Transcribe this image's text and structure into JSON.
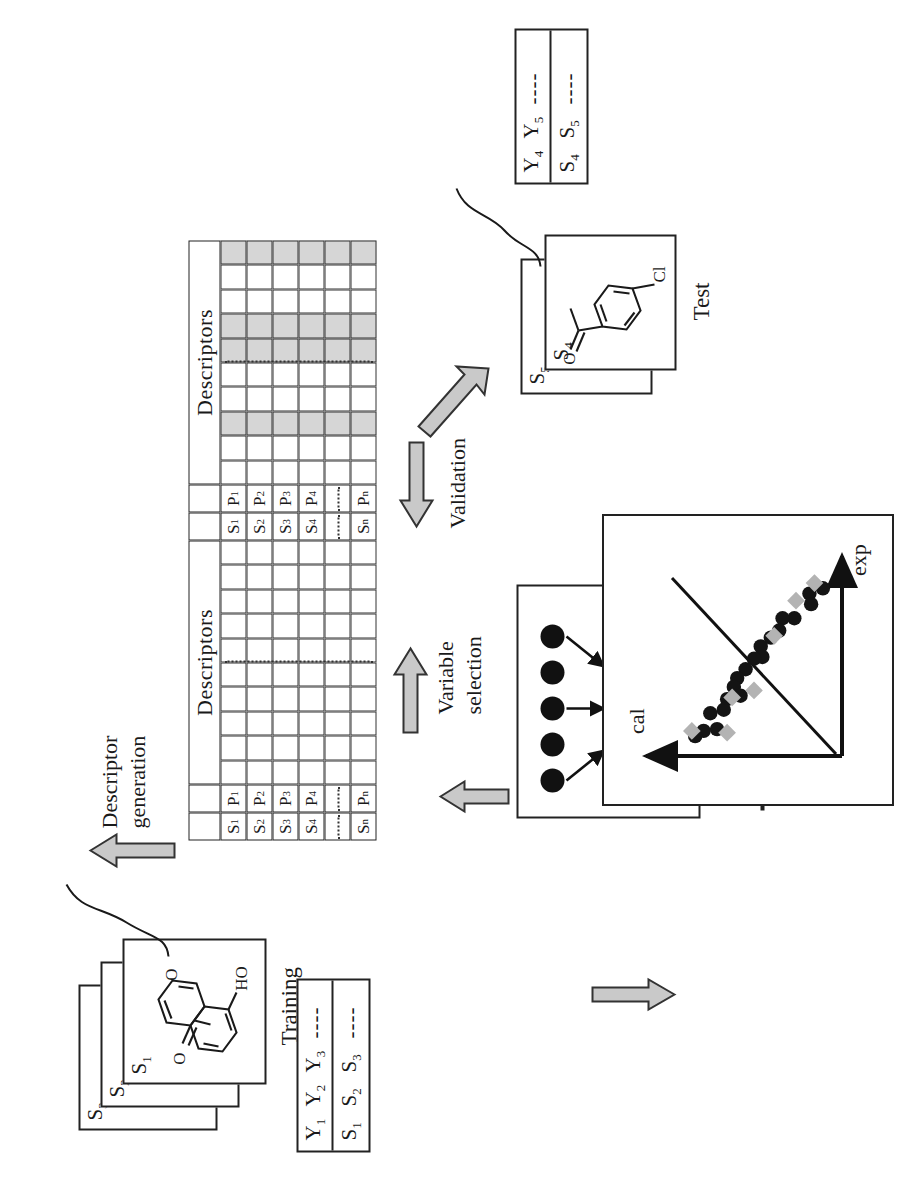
{
  "figure": {
    "orientation": "rotated-90-ccw"
  },
  "training": {
    "group_label": "Training",
    "cards": [
      {
        "tag": "S",
        "sub": "1",
        "molecule": "7-hydroxychromen-4-one",
        "atom_labels": [
          "O",
          "O",
          "HO"
        ]
      },
      {
        "tag": "S",
        "sub": "2",
        "molecule": ""
      },
      {
        "tag": "S",
        "sub": "3",
        "molecule": ""
      }
    ],
    "table": {
      "row_samples": [
        "S₁",
        "S₂",
        "S₃"
      ],
      "row_responses": [
        "Y₁",
        "Y₂",
        "Y₃"
      ],
      "continuation": "----"
    }
  },
  "test": {
    "group_label": "Test",
    "cards": [
      {
        "tag": "S",
        "sub": "4",
        "molecule": "3'-chloroacetophenone",
        "atom_labels": [
          "O",
          "Cl"
        ]
      },
      {
        "tag": "S",
        "sub": "5",
        "molecule": ""
      }
    ],
    "table": {
      "row_samples": [
        "S₄",
        "S₅"
      ],
      "row_responses": [
        "Y₄",
        "Y₅"
      ],
      "continuation": "----"
    }
  },
  "matrix_full": {
    "title": "Descriptors",
    "sample_headers": [
      "S₁",
      "S₂",
      "S₃",
      "S₄",
      "Sₙ"
    ],
    "property_headers": [
      "P₁",
      "P₂",
      "P₃",
      "P₄",
      "Pₙ"
    ],
    "descriptor_headers": [
      "d₁₁",
      "d₁₂",
      "d₁₃",
      "d₁₄"
    ],
    "continuation": "----",
    "n_descriptor_columns": 10,
    "selected_columns": []
  },
  "matrix_selected": {
    "title": "Descriptors",
    "sample_headers": [
      "S₁",
      "S₂",
      "S₃",
      "S₄",
      "Sₙ"
    ],
    "property_headers": [
      "P₁",
      "P₂",
      "P₃",
      "P₄",
      "Pₙ"
    ],
    "descriptor_headers": [
      "d₁₁",
      "d₁₂",
      "d₁₃",
      "d₁₄"
    ],
    "continuation": "----",
    "n_descriptor_columns": 10,
    "selected_columns": [
      2,
      5,
      6,
      9
    ]
  },
  "steps": {
    "descriptor_generation": "Descriptor\ngeneration",
    "descriptor_generation_line1": "Descriptor",
    "descriptor_generation_line2": "generation",
    "variable_selection_line1": "Variable",
    "variable_selection_line2": "selection",
    "validation": "Validation",
    "model": "Model"
  },
  "model": {
    "label": "Model",
    "layers": [
      5,
      3,
      1
    ],
    "node_color": "#111111"
  },
  "chart_data": {
    "type": "scatter",
    "title": "",
    "xlabel": "cal",
    "ylabel": "exp",
    "grid": false,
    "legend": null,
    "axis_arrows": true,
    "series": [
      {
        "name": "calibration",
        "marker": "circle",
        "color": "#141414",
        "points": [
          [
            0.09,
            0.93
          ],
          [
            0.17,
            0.9
          ],
          [
            0.16,
            0.84
          ],
          [
            0.26,
            0.76
          ],
          [
            0.33,
            0.76
          ],
          [
            0.35,
            0.69
          ],
          [
            0.4,
            0.65
          ],
          [
            0.46,
            0.6
          ],
          [
            0.45,
            0.54
          ],
          [
            0.5,
            0.53
          ],
          [
            0.55,
            0.47
          ],
          [
            0.6,
            0.42
          ],
          [
            0.62,
            0.37
          ],
          [
            0.58,
            0.32
          ],
          [
            0.66,
            0.3
          ],
          [
            0.68,
            0.24
          ],
          [
            0.76,
            0.22
          ],
          [
            0.72,
            0.13
          ],
          [
            0.8,
            0.12
          ],
          [
            0.85,
            0.09
          ]
        ]
      },
      {
        "name": "validation",
        "marker": "diamond",
        "color": "#b3b3b3",
        "points": [
          [
            0.14,
            0.96
          ],
          [
            0.25,
            0.86
          ],
          [
            0.38,
            0.66
          ],
          [
            0.5,
            0.35
          ],
          [
            0.63,
            0.31
          ],
          [
            0.66,
            0.11
          ],
          [
            0.87,
            0.12
          ]
        ]
      }
    ],
    "regression_line": {
      "from": [
        0.06,
        0.98
      ],
      "to": [
        0.92,
        0.02
      ]
    },
    "xlim": [
      0,
      1
    ],
    "ylim": [
      0,
      1
    ]
  },
  "colors": {
    "arrow_fill": "#c9c9c9",
    "arrow_stroke": "#333333",
    "shade": "#d6d6d6",
    "ink": "#1a1a1a"
  }
}
